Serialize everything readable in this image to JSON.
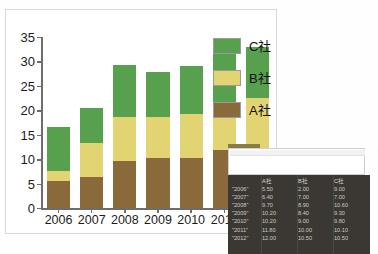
{
  "top_sliver_text": "",
  "chart_data": {
    "type": "bar",
    "subtype": "stacked",
    "title": "",
    "xlabel": "",
    "ylabel": "",
    "categories": [
      "2006",
      "2007",
      "2008",
      "2009",
      "2010",
      "2011",
      "2012"
    ],
    "series": [
      {
        "name": "A社",
        "color": "#8a6a3a",
        "values": [
          5.5,
          6.4,
          9.7,
          10.2,
          10.2,
          11.8,
          12.0
        ]
      },
      {
        "name": "B社",
        "color": "#e2d473",
        "values": [
          2.0,
          7.0,
          8.9,
          8.4,
          9.0,
          10.0,
          10.5
        ]
      },
      {
        "name": "C社",
        "color": "#57a14e",
        "values": [
          9.0,
          7.0,
          10.6,
          9.3,
          9.8,
          10.1,
          10.5
        ]
      }
    ],
    "totals": [
      16.5,
      20.4,
      29.2,
      27.9,
      29.0,
      31.9,
      33.0
    ],
    "ylim": [
      0,
      35
    ],
    "yticks": [
      0,
      5,
      10,
      15,
      20,
      25,
      30,
      35
    ],
    "grid": false,
    "legend_position": "top-right",
    "legend_order": [
      "C社",
      "B社",
      "A社"
    ]
  },
  "legend": {
    "items": [
      {
        "label": "C社",
        "color": "#57a14e",
        "name": "legend-item-c"
      },
      {
        "label": "B社",
        "color": "#e2d473",
        "name": "legend-item-b"
      },
      {
        "label": "A社",
        "color": "#8a6a3a",
        "name": "legend-item-a"
      }
    ]
  },
  "data_table": {
    "headers": [
      "",
      "A社",
      "B社",
      "C社"
    ],
    "rows": [
      {
        "year": "\"2006\"",
        "a": "5.50",
        "b": "2.00",
        "c": "9.00"
      },
      {
        "year": "\"2007\"",
        "a": "6.40",
        "b": "7.00",
        "c": "7.00"
      },
      {
        "year": "\"2008\"",
        "a": "9.70",
        "b": "8.90",
        "c": "10.60"
      },
      {
        "year": "\"2009\"",
        "a": "10.20",
        "b": "8.40",
        "c": "9.30"
      },
      {
        "year": "\"2010\"",
        "a": "10.20",
        "b": "9.00",
        "c": "9.80"
      },
      {
        "year": "\"2011\"",
        "a": "11.80",
        "b": "10.00",
        "c": "10.10"
      },
      {
        "year": "\"2012\"",
        "a": "12.00",
        "b": "10.50",
        "c": "10.50"
      }
    ]
  },
  "colors": {
    "series_a": "#8a6a3a",
    "series_b": "#e2d473",
    "series_c": "#57a14e",
    "axis": "#6d6d6d",
    "panel_dark": "#3b3733",
    "chart_bg": "#ffffff"
  }
}
